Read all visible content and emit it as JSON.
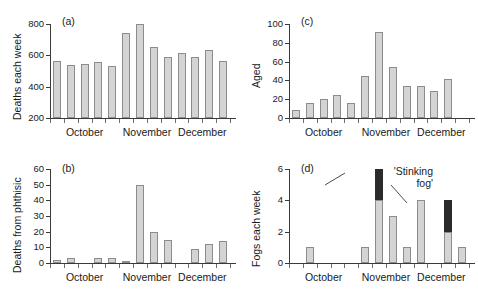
{
  "figure": {
    "months": [
      "October",
      "November",
      "December"
    ],
    "panel_tags": {
      "a": "(a)",
      "b": "(b)",
      "c": "(c)",
      "d": "(d)"
    },
    "annotation": {
      "line1": "'Stinking",
      "line2": "fog'"
    },
    "colors": {
      "bar_fill": "#d4d4d4",
      "bar_stroke": "#8c8c8c",
      "dark_fill": "#2b2b2b",
      "axis": "#3a3a3a"
    }
  },
  "chart_data": [
    {
      "type": "bar",
      "panel": "(a)",
      "title": "",
      "xlabel": "",
      "ylabel": "Deaths each week",
      "ylim": [
        200,
        800
      ],
      "yticks": [
        200,
        400,
        600,
        800
      ],
      "ytick_labels": [
        "200",
        "400",
        "600",
        "800"
      ],
      "grid": false,
      "categories": [
        "w1",
        "w2",
        "w3",
        "w4",
        "w5",
        "w6",
        "w7",
        "w8",
        "w9",
        "w10",
        "w11",
        "w12",
        "w13"
      ],
      "xtick_group_labels": [
        "October",
        "November",
        "December"
      ],
      "values": [
        363,
        338,
        347,
        360,
        334,
        541,
        775,
        456,
        390,
        412,
        391,
        433,
        367
      ]
    },
    {
      "type": "bar",
      "panel": "(b)",
      "title": "",
      "xlabel": "",
      "ylabel": "Deaths from phthisic",
      "ylim": [
        0,
        60
      ],
      "yticks": [
        0,
        10,
        20,
        30,
        40,
        50,
        60
      ],
      "ytick_labels": [
        "0",
        "10",
        "20",
        "30",
        "40",
        "50",
        "60"
      ],
      "grid": false,
      "categories": [
        "w1",
        "w2",
        "w3",
        "w4",
        "w5",
        "w6",
        "w7",
        "w8",
        "w9",
        "w10",
        "w11",
        "w12",
        "w13"
      ],
      "xtick_group_labels": [
        "October",
        "November",
        "December"
      ],
      "values": [
        2,
        3,
        0,
        3,
        3,
        1,
        50,
        20,
        15,
        0,
        9,
        12,
        14
      ]
    },
    {
      "type": "bar",
      "panel": "(c)",
      "title": "",
      "xlabel": "",
      "ylabel": "Aged",
      "ylim": [
        0,
        100
      ],
      "yticks": [
        0,
        20,
        40,
        60,
        80,
        100
      ],
      "ytick_labels": [
        "0",
        "20",
        "40",
        "60",
        "80",
        "100"
      ],
      "grid": false,
      "categories": [
        "w1",
        "w2",
        "w3",
        "w4",
        "w5",
        "w6",
        "w7",
        "w8",
        "w9",
        "w10",
        "w11",
        "w12",
        "w13"
      ],
      "xtick_group_labels": [
        "October",
        "November",
        "December"
      ],
      "values": [
        9,
        16,
        20,
        25,
        16,
        45,
        91,
        54,
        34,
        34,
        29,
        41,
        0
      ]
    },
    {
      "type": "bar",
      "panel": "(d)",
      "title": "",
      "xlabel": "",
      "ylabel": "Fogs each week",
      "ylim": [
        0,
        6
      ],
      "yticks": [
        0,
        2,
        4,
        6
      ],
      "ytick_labels": [
        "0",
        "2",
        "4",
        "6"
      ],
      "grid": false,
      "stacked": true,
      "annotation": "'Stinking fog'",
      "categories": [
        "w1",
        "w2",
        "w3",
        "w4",
        "w5",
        "w6",
        "w7",
        "w8",
        "w9",
        "w10",
        "w11",
        "w12",
        "w13"
      ],
      "xtick_group_labels": [
        "October",
        "November",
        "December"
      ],
      "series": [
        {
          "name": "fogs",
          "values": [
            0,
            1,
            0,
            0,
            0,
            1,
            4,
            3,
            1,
            4,
            0,
            2,
            1
          ]
        },
        {
          "name": "'Stinking fog'",
          "values": [
            0,
            0,
            0,
            0,
            0,
            0,
            2,
            0,
            0,
            0,
            0,
            2,
            0
          ]
        }
      ]
    }
  ]
}
